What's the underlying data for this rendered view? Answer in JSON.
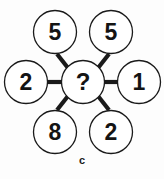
{
  "figure": {
    "caption": "c",
    "center": {
      "value": "?",
      "cx": 83,
      "cy": 82,
      "r": 21.5
    },
    "nodes": [
      {
        "name": "top-left",
        "value": "5",
        "cx": 55,
        "cy": 32,
        "r": 21.5
      },
      {
        "name": "top-right",
        "value": "5",
        "cx": 111,
        "cy": 32,
        "r": 21.5
      },
      {
        "name": "right",
        "value": "1",
        "cx": 139,
        "cy": 82,
        "r": 21.5
      },
      {
        "name": "bottom-right",
        "value": "2",
        "cx": 111,
        "cy": 132,
        "r": 21.5
      },
      {
        "name": "bottom-left",
        "value": "8",
        "cx": 55,
        "cy": 132,
        "r": 21.5
      },
      {
        "name": "left",
        "value": "2",
        "cx": 26,
        "cy": 82,
        "r": 21.5
      }
    ],
    "spokes": [
      {
        "name": "spoke-top-left",
        "x1": 68,
        "y1": 68,
        "x2": 57,
        "y2": 54
      },
      {
        "name": "spoke-top-right",
        "x1": 98,
        "y1": 68,
        "x2": 109,
        "y2": 54
      },
      {
        "name": "spoke-right",
        "x1": 104,
        "y1": 82,
        "x2": 118,
        "y2": 82
      },
      {
        "name": "spoke-bottom-right",
        "x1": 98,
        "y1": 96,
        "x2": 109,
        "y2": 110
      },
      {
        "name": "spoke-bottom-left",
        "x1": 68,
        "y1": 96,
        "x2": 57,
        "y2": 110
      },
      {
        "name": "spoke-left",
        "x1": 62,
        "y1": 82,
        "x2": 48,
        "y2": 82
      }
    ],
    "colors": {
      "stroke": "#1a1a1a",
      "fill": "#ffffff",
      "background": "#fdfdfd",
      "text": "#141414"
    }
  }
}
